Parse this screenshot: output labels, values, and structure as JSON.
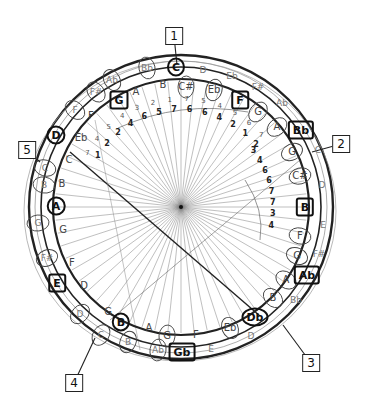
{
  "diagram": {
    "type": "hand-drawn circular music theory diagram",
    "center": {
      "x": 181,
      "y": 207
    },
    "callouts": [
      {
        "label": "1",
        "x": 174,
        "y": 36,
        "lx": 177,
        "ly": 65
      },
      {
        "label": "2",
        "x": 341,
        "y": 144,
        "lx": 312,
        "ly": 152
      },
      {
        "label": "3",
        "x": 311,
        "y": 363,
        "lx": 283,
        "ly": 325
      },
      {
        "label": "4",
        "x": 74,
        "y": 383,
        "lx": 95,
        "ly": 338
      },
      {
        "label": "5",
        "x": 27,
        "y": 150,
        "lx": 40,
        "ly": 162
      }
    ],
    "key_notes": [
      {
        "label": "C",
        "x": 176,
        "y": 67,
        "shape": "circle"
      },
      {
        "label": "G",
        "x": 119,
        "y": 100,
        "shape": "boxed"
      },
      {
        "label": "F",
        "x": 240,
        "y": 100,
        "shape": "boxed"
      },
      {
        "label": "D",
        "x": 56,
        "y": 135,
        "shape": "circle"
      },
      {
        "label": "Bb",
        "x": 301,
        "y": 130,
        "shape": "boxed"
      },
      {
        "label": "A",
        "x": 56,
        "y": 206,
        "shape": "circle"
      },
      {
        "label": "B",
        "x": 305,
        "y": 207,
        "shape": "boxed"
      },
      {
        "label": "E",
        "x": 57,
        "y": 283,
        "shape": "boxed"
      },
      {
        "label": "Ab",
        "x": 307,
        "y": 275,
        "shape": "boxed"
      },
      {
        "label": "B",
        "x": 121,
        "y": 322,
        "shape": "circle"
      },
      {
        "label": "Db",
        "x": 255,
        "y": 317,
        "shape": "circle"
      },
      {
        "label": "Gb",
        "x": 182,
        "y": 352,
        "shape": "boxed"
      }
    ],
    "outer_ring_notes": [
      {
        "label": "Bb",
        "x": 147,
        "y": 68
      },
      {
        "label": "D",
        "x": 203,
        "y": 70
      },
      {
        "label": "Ab",
        "x": 112,
        "y": 80
      },
      {
        "label": "Eb",
        "x": 232,
        "y": 76
      },
      {
        "label": "F#",
        "x": 96,
        "y": 92
      },
      {
        "label": "F#",
        "x": 258,
        "y": 87
      },
      {
        "label": "F",
        "x": 75,
        "y": 110
      },
      {
        "label": "Ab",
        "x": 282,
        "y": 103
      },
      {
        "label": "C",
        "x": 45,
        "y": 168
      },
      {
        "label": "C",
        "x": 318,
        "y": 150
      },
      {
        "label": "B",
        "x": 44,
        "y": 185
      },
      {
        "label": "D",
        "x": 322,
        "y": 185
      },
      {
        "label": "G",
        "x": 38,
        "y": 223
      },
      {
        "label": "E",
        "x": 323,
        "y": 225
      },
      {
        "label": "F#",
        "x": 47,
        "y": 258
      },
      {
        "label": "F#",
        "x": 319,
        "y": 254
      },
      {
        "label": "D",
        "x": 80,
        "y": 314
      },
      {
        "label": "Bb",
        "x": 296,
        "y": 300
      },
      {
        "label": "C",
        "x": 101,
        "y": 335
      },
      {
        "label": "D",
        "x": 251,
        "y": 336
      },
      {
        "label": "B",
        "x": 128,
        "y": 342
      },
      {
        "label": "E",
        "x": 211,
        "y": 349
      },
      {
        "label": "Ab",
        "x": 158,
        "y": 350
      }
    ],
    "inner_ring_notes": [
      {
        "label": "B",
        "x": 163,
        "y": 85
      },
      {
        "label": "C#",
        "x": 186,
        "y": 87
      },
      {
        "label": "A",
        "x": 136,
        "y": 92
      },
      {
        "label": "Eb",
        "x": 214,
        "y": 90
      },
      {
        "label": "F",
        "x": 91,
        "y": 116
      },
      {
        "label": "G",
        "x": 258,
        "y": 112
      },
      {
        "label": "Eb",
        "x": 81,
        "y": 138
      },
      {
        "label": "A",
        "x": 277,
        "y": 127
      },
      {
        "label": "C",
        "x": 69,
        "y": 160
      },
      {
        "label": "G",
        "x": 292,
        "y": 152
      },
      {
        "label": "B",
        "x": 62,
        "y": 184
      },
      {
        "label": "C#",
        "x": 300,
        "y": 176
      },
      {
        "label": "G",
        "x": 63,
        "y": 230
      },
      {
        "label": "F",
        "x": 300,
        "y": 236
      },
      {
        "label": "F",
        "x": 72,
        "y": 263
      },
      {
        "label": "G",
        "x": 297,
        "y": 256
      },
      {
        "label": "D",
        "x": 84,
        "y": 286
      },
      {
        "label": "A",
        "x": 286,
        "y": 280
      },
      {
        "label": "G",
        "x": 108,
        "y": 312
      },
      {
        "label": "B",
        "x": 273,
        "y": 298
      },
      {
        "label": "A",
        "x": 149,
        "y": 328
      },
      {
        "label": "G",
        "x": 167,
        "y": 336
      },
      {
        "label": "F",
        "x": 196,
        "y": 335
      },
      {
        "label": "Eb",
        "x": 230,
        "y": 328
      }
    ],
    "degree_rows": {
      "top_row": [
        "7",
        "4",
        "5",
        "4",
        "3",
        "2",
        "1",
        "7",
        "5",
        "4",
        "5",
        "6",
        "7"
      ],
      "bottom_row": [
        "1",
        "2",
        "2",
        "4",
        "6",
        "5",
        "7",
        "6",
        "6",
        "4",
        "2",
        "1",
        "2"
      ],
      "right_column": [
        "3",
        "4",
        "6",
        "6",
        "7",
        "7",
        "3",
        "4"
      ]
    }
  }
}
